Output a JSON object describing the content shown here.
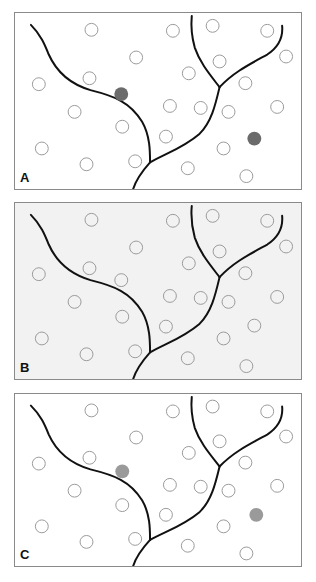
{
  "figure": {
    "panels": [
      {
        "label": "A",
        "background": "#ffffff",
        "filled_color": "#6b6b6b",
        "filled_circles": [
          [
            107,
            82
          ],
          [
            241,
            127
          ]
        ]
      },
      {
        "label": "B",
        "background": "#f2f2f2",
        "filled_color": "#6b6b6b",
        "filled_circles": []
      },
      {
        "label": "C",
        "background": "#ffffff",
        "filled_color": "#9a9a9a",
        "filled_circles": [
          [
            108,
            80
          ],
          [
            243,
            125
          ]
        ]
      }
    ],
    "open_circles": [
      [
        77,
        17
      ],
      [
        159,
        18
      ],
      [
        199,
        13
      ],
      [
        254,
        18
      ],
      [
        122,
        45
      ],
      [
        273,
        44
      ],
      [
        206,
        49
      ],
      [
        75,
        66
      ],
      [
        175,
        61
      ],
      [
        24,
        72
      ],
      [
        232,
        71
      ],
      [
        60,
        100
      ],
      [
        156,
        94
      ],
      [
        187,
        96
      ],
      [
        215,
        100
      ],
      [
        264,
        95
      ],
      [
        108,
        115
      ],
      [
        152,
        125
      ],
      [
        27,
        137
      ],
      [
        210,
        137
      ],
      [
        72,
        153
      ],
      [
        121,
        150
      ],
      [
        174,
        157
      ],
      [
        233,
        165
      ]
    ],
    "panel_b_extra_open_circles": [
      [
        107,
        78
      ],
      [
        241,
        124
      ]
    ],
    "circle_radius": 6.5,
    "open_circle_stroke": "#9a9a9a",
    "river_color": "#111111",
    "river_paths": [
      "M16,12 C26,22 30,32 34,42 C42,60 56,72 76,78 C100,84 116,90 128,110 C136,124 136,140 136,151",
      "M136,151 C152,142 170,136 186,122 C198,110 202,92 206,75",
      "M206,75 C196,62 186,50 181,35 C178,24 177,14 178,3",
      "M206,75 C220,60 236,52 254,42 C266,34 270,24 269,13",
      "M136,151 C128,160 122,168 119,178"
    ]
  }
}
